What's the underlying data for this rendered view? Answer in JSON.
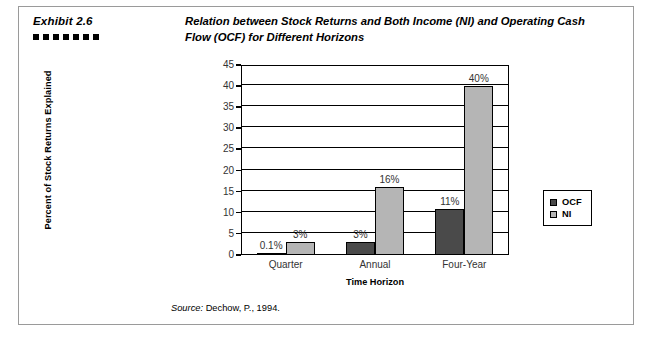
{
  "exhibit": {
    "label": "Exhibit 2.6",
    "square_count": 7,
    "title": "Relation between Stock Returns and Both Income (NI) and Operating Cash Flow (OCF) for Different Horizons",
    "source_prefix": "Source:",
    "source_text": " Dechow, P., 1994."
  },
  "colors": {
    "ocf": "#4a4a4a",
    "ni": "#b5b5b5",
    "axis": "#000000",
    "frame": "#9a9a9a"
  },
  "legend": {
    "items": [
      {
        "name": "OCF",
        "color": "#4a4a4a"
      },
      {
        "name": "NI",
        "color": "#b5b5b5"
      }
    ]
  },
  "chart_data": {
    "type": "bar",
    "title": "Relation between Stock Returns and Both Income (NI) and Operating Cash Flow (OCF) for Different Horizons",
    "xlabel": "Time Horizon",
    "ylabel": "Percent of Stock Returns Explained",
    "categories": [
      "Quarter",
      "Annual",
      "Four-Year"
    ],
    "ylim": [
      0,
      45
    ],
    "yticks": [
      0,
      5,
      10,
      15,
      20,
      25,
      30,
      35,
      40,
      45
    ],
    "ytick_labels": [
      "0",
      "5",
      "10",
      "15",
      "20",
      "25",
      "30",
      "35",
      "40",
      "45"
    ],
    "grid": true,
    "legend_position": "right",
    "series": [
      {
        "name": "OCF",
        "color": "#4a4a4a",
        "values": [
          0.1,
          3,
          11
        ],
        "labels": [
          "0.1%",
          "3%",
          "11%"
        ]
      },
      {
        "name": "NI",
        "color": "#b5b5b5",
        "values": [
          3,
          16,
          40
        ],
        "labels": [
          "3%",
          "16%",
          "40%"
        ]
      }
    ]
  }
}
